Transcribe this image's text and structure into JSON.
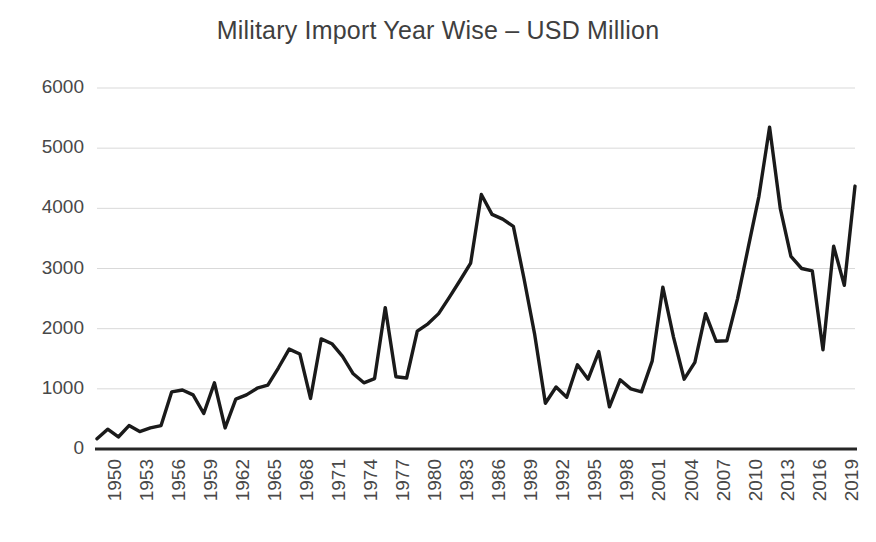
{
  "chart": {
    "title": "Military Import Year Wise – USD Million",
    "title_color": "#3f3f3f",
    "line_color": "#1a1a1a",
    "gridline_color": "#d9d9d9",
    "axis_color": "#262626",
    "background": "#ffffff",
    "tick_label_color": "#484848"
  },
  "chart_data": {
    "type": "line",
    "title": "Military Import Year Wise – USD Million",
    "xlabel": "",
    "ylabel": "",
    "ylim": [
      0,
      6000
    ],
    "xlim": [
      1950,
      2021
    ],
    "grid": true,
    "legend": false,
    "y_ticks": [
      0,
      1000,
      2000,
      3000,
      4000,
      5000,
      6000
    ],
    "y_tick_labels": [
      "0",
      "1000",
      "2000",
      "3000",
      "4000",
      "5000",
      "6000"
    ],
    "x_tick_labels": [
      "1950",
      "1953",
      "1956",
      "1959",
      "1962",
      "1965",
      "1968",
      "1971",
      "1974",
      "1977",
      "1980",
      "1983",
      "1986",
      "1989",
      "1992",
      "1995",
      "1998",
      "2001",
      "2004",
      "2007",
      "2010",
      "2013",
      "2016",
      "2019"
    ],
    "x_tick_years": [
      1950,
      1953,
      1956,
      1959,
      1962,
      1965,
      1968,
      1971,
      1974,
      1977,
      1980,
      1983,
      1986,
      1989,
      1992,
      1995,
      1998,
      2001,
      2004,
      2007,
      2010,
      2013,
      2016,
      2019
    ],
    "x": [
      1950,
      1951,
      1952,
      1953,
      1954,
      1955,
      1956,
      1957,
      1958,
      1959,
      1960,
      1961,
      1962,
      1963,
      1964,
      1965,
      1966,
      1967,
      1968,
      1969,
      1970,
      1971,
      1972,
      1973,
      1974,
      1975,
      1976,
      1977,
      1978,
      1979,
      1980,
      1981,
      1982,
      1983,
      1984,
      1985,
      1986,
      1987,
      1988,
      1989,
      1990,
      1991,
      1992,
      1993,
      1994,
      1995,
      1996,
      1997,
      1998,
      1999,
      2000,
      2001,
      2002,
      2003,
      2004,
      2005,
      2006,
      2007,
      2008,
      2009,
      2010,
      2011,
      2012,
      2013,
      2014,
      2015,
      2016,
      2017,
      2018,
      2019,
      2020,
      2021
    ],
    "values": [
      170,
      330,
      200,
      390,
      290,
      350,
      390,
      950,
      980,
      900,
      590,
      1100,
      350,
      830,
      900,
      1010,
      1060,
      1350,
      1660,
      1580,
      840,
      1830,
      1750,
      1540,
      1250,
      1100,
      1170,
      2350,
      1200,
      1180,
      1960,
      2080,
      2250,
      2520,
      2800,
      3090,
      4230,
      3900,
      3820,
      3700,
      2830,
      1900,
      760,
      1030,
      860,
      1400,
      1160,
      1620,
      700,
      1150,
      1000,
      950,
      1460,
      2690,
      1860,
      1160,
      1440,
      2250,
      1790,
      1800,
      2500,
      3350,
      4200,
      5350,
      4000,
      3200,
      3000,
      2960,
      1650,
      3370,
      2720,
      4370
    ],
    "series": [
      {
        "name": "Military Import (USD Million)",
        "values": [
          170,
          330,
          200,
          390,
          290,
          350,
          390,
          950,
          980,
          900,
          590,
          1100,
          350,
          830,
          900,
          1010,
          1060,
          1350,
          1660,
          1580,
          840,
          1830,
          1750,
          1540,
          1250,
          1100,
          1170,
          2350,
          1200,
          1180,
          1960,
          2080,
          2250,
          2520,
          2800,
          3090,
          4230,
          3900,
          3820,
          3700,
          2830,
          1900,
          760,
          1030,
          860,
          1400,
          1160,
          1620,
          700,
          1150,
          1000,
          950,
          1460,
          2690,
          1860,
          1160,
          1440,
          2250,
          1790,
          1800,
          2500,
          3350,
          4200,
          5350,
          4000,
          3200,
          3000,
          2960,
          1650,
          3370,
          2720,
          4370
        ]
      }
    ]
  }
}
